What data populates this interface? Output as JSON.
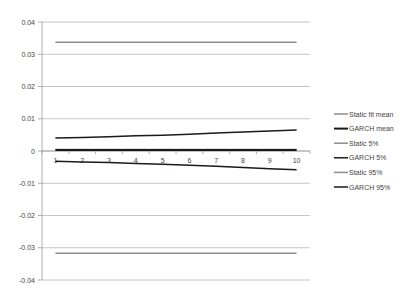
{
  "chart_data": {
    "type": "line",
    "title": "",
    "xlabel": "",
    "ylabel": "",
    "x": [
      1,
      2,
      3,
      4,
      5,
      6,
      7,
      8,
      9,
      10
    ],
    "ylim": [
      -0.04,
      0.04
    ],
    "yticks": [
      "0.04",
      "0.03",
      "0.02",
      "0.01",
      "0",
      "-0.01",
      "-0.02",
      "-0.03",
      "-0.04"
    ],
    "xticks": [
      "1",
      "2",
      "3",
      "4",
      "5",
      "6",
      "7",
      "8",
      "9",
      "10"
    ],
    "grid": true,
    "legend_position": "right",
    "series": [
      {
        "name": "Static fit mean",
        "color": "#8c8c8c",
        "width": 1.5,
        "values": [
          0.0005,
          0.0005,
          0.0005,
          0.0005,
          0.0005,
          0.0005,
          0.0005,
          0.0005,
          0.0005,
          0.0005
        ]
      },
      {
        "name": "GARCH mean",
        "color": "#1a1a1a",
        "width": 2,
        "values": [
          0.0003,
          0.0003,
          0.0003,
          0.0003,
          0.0003,
          0.0003,
          0.0003,
          0.0003,
          0.0003,
          0.0003
        ]
      },
      {
        "name": "Static 5%",
        "color": "#8c8c8c",
        "width": 1.5,
        "values": [
          0.0337,
          0.0337,
          0.0337,
          0.0337,
          0.0337,
          0.0337,
          0.0337,
          0.0337,
          0.0337,
          0.0337
        ]
      },
      {
        "name": "GARCH 5%",
        "color": "#1a1a1a",
        "width": 1.5,
        "values": [
          0.004,
          0.0042,
          0.0044,
          0.0047,
          0.0049,
          0.0052,
          0.0056,
          0.0059,
          0.0062,
          0.0065
        ]
      },
      {
        "name": "Static 95%",
        "color": "#8c8c8c",
        "width": 1.5,
        "values": [
          -0.0317,
          -0.0317,
          -0.0317,
          -0.0317,
          -0.0317,
          -0.0317,
          -0.0317,
          -0.0317,
          -0.0317,
          -0.0317
        ]
      },
      {
        "name": "GARCH 95%",
        "color": "#1a1a1a",
        "width": 1.5,
        "values": [
          -0.0032,
          -0.0034,
          -0.0036,
          -0.0039,
          -0.0041,
          -0.0044,
          -0.0047,
          -0.0051,
          -0.0055,
          -0.0058
        ]
      }
    ]
  }
}
